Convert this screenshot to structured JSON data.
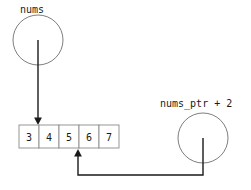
{
  "diagram": {
    "type": "pointer-array-diagram",
    "background_color": "#ffffff",
    "line_color": "#1a1a1a",
    "circle_stroke_color": "#6e6e6e",
    "box_stroke_color": "#8a8a8a",
    "text_color": "#1a1a1a",
    "width": 251,
    "height": 190
  },
  "pointers": [
    {
      "id": "nums",
      "label": "nums",
      "label_x": 20,
      "label_y": 13,
      "circle": {
        "cx": 38,
        "cy": 40,
        "r": 25
      },
      "target_index": 0,
      "target_label": "3"
    },
    {
      "id": "nums_ptr_plus_2",
      "label": "nums_ptr + 2",
      "label_x": 160,
      "label_y": 107,
      "circle": {
        "cx": 203,
        "cy": 138,
        "r": 25
      },
      "target_index": 2,
      "target_label": "5"
    }
  ],
  "array": {
    "name": "nums",
    "x": 19,
    "y": 125,
    "cell_width": 20,
    "cell_height": 23,
    "cells": [
      {
        "index": 0,
        "value": "3"
      },
      {
        "index": 1,
        "value": "4"
      },
      {
        "index": 2,
        "value": "5"
      },
      {
        "index": 3,
        "value": "6"
      },
      {
        "index": 4,
        "value": "7"
      }
    ]
  },
  "edges": [
    {
      "id": "edge-nums-to-cell0",
      "from": "nums",
      "to_cell_index": 0,
      "path": "M 38 40 L 38 119",
      "arrow_points": "38,125 34.1,117.5 41.9,117.5",
      "direction": "down"
    },
    {
      "id": "edge-numsptr-to-cell2",
      "from": "nums_ptr_plus_2",
      "to_cell_index": 2,
      "path": "M 203 138 L 203 175 L 78 175 L 78 156",
      "arrow_points": "78,149 74.1,156.5 81.9,156.5",
      "direction": "up"
    }
  ]
}
